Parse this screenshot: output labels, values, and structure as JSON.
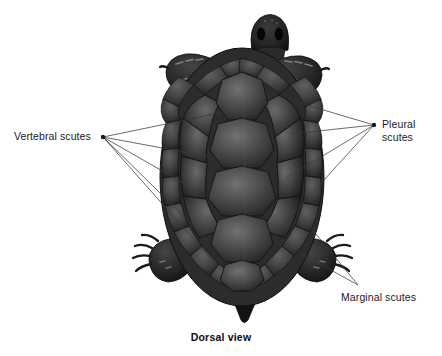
{
  "figure": {
    "caption": "Dorsal view",
    "background_color": "#ffffff",
    "labels": [
      {
        "id": "vertebral",
        "text": "Vertebral scutes",
        "anchor_x": 103,
        "anchor_y": 137,
        "position": "left"
      },
      {
        "id": "pleural",
        "text": "Pleural\nscutes",
        "anchor_x": 374,
        "anchor_y": 125,
        "position": "right"
      },
      {
        "id": "marginal",
        "text": "Marginal scutes",
        "anchor_x": 358,
        "anchor_y": 285,
        "position": "bottom-right"
      }
    ],
    "colors": {
      "shell_dark": "#2b2b2b",
      "shell_mid": "#4a4a4a",
      "shell_light": "#6e6e6e",
      "shell_outline": "#141414",
      "body_dark": "#1d1d1d",
      "leader_line": "#3a3a3a",
      "label_text": "#1b1b1b"
    },
    "leader_lines": {
      "vertebral_targets": [
        [
          224,
          112
        ],
        [
          211,
          157
        ],
        [
          206,
          196
        ],
        [
          208,
          240
        ],
        [
          228,
          278
        ]
      ],
      "pleural_targets": [
        [
          300,
          103
        ],
        [
          290,
          134
        ],
        [
          286,
          178
        ],
        [
          274,
          235
        ]
      ],
      "marginal_targets": [
        [
          300,
          253
        ],
        [
          311,
          228
        ]
      ]
    },
    "anatomy": {
      "vertebral_scute_count": 5,
      "pleural_scute_count_per_side": 4,
      "marginal_scute_count": 24,
      "shell_bounds": [
        162,
        48,
        322,
        305
      ],
      "head_bounds": [
        248,
        14,
        292,
        58
      ],
      "tail_bounds": [
        228,
        292,
        262,
        322
      ],
      "limbs": [
        "front-left-flipper",
        "front-right-flipper",
        "rear-left-leg",
        "rear-right-leg"
      ]
    }
  }
}
